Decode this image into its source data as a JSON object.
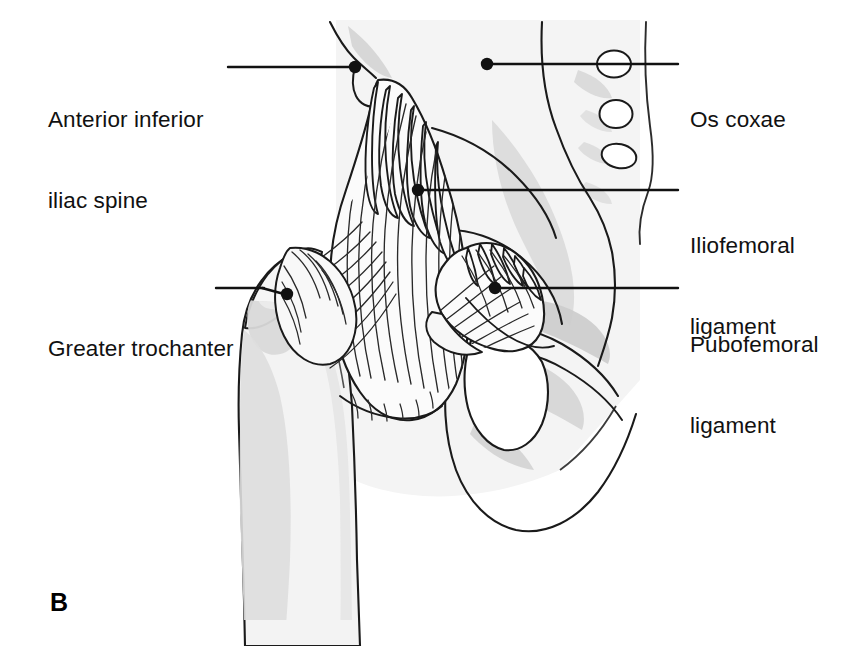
{
  "figure": {
    "panel_letter": "B",
    "view": "Anterior view of the right hip joint showing the capsular ligaments",
    "background_color": "#ffffff",
    "line_color": "#1a1a1a",
    "bone_fill_color": "#f2f2f2",
    "bone_shadow_color": "#d4d4d4",
    "ligament_fill_color": "#fbfbfb"
  },
  "labels": [
    {
      "id": "anterior-inferior-iliac-spine",
      "lines": [
        "Anterior inferior",
        "iliac spine"
      ],
      "text": "Anterior inferior iliac spine",
      "side": "left",
      "text_x": 48,
      "text_y": 52,
      "leader_start_x": 228,
      "leader_start_y": 67,
      "leader_end_x": 352,
      "leader_end_y": 67,
      "dot_x": 355,
      "dot_y": 67
    },
    {
      "id": "os-coxae",
      "lines": [
        "Os coxae"
      ],
      "text": "Os coxae",
      "side": "right",
      "text_x": 690,
      "text_y": 52,
      "leader_start_x": 490,
      "leader_start_y": 64,
      "leader_end_x": 678,
      "leader_end_y": 64,
      "dot_x": 487,
      "dot_y": 64
    },
    {
      "id": "iliofemoral-ligament",
      "lines": [
        "Iliofemoral",
        "ligament"
      ],
      "text": "Iliofemoral ligament",
      "side": "right",
      "text_x": 690,
      "text_y": 178,
      "leader_start_x": 421,
      "leader_start_y": 190,
      "leader_end_x": 678,
      "leader_end_y": 190,
      "dot_x": 418,
      "dot_y": 190
    },
    {
      "id": "pubofemoral-ligament",
      "lines": [
        "Pubofemoral",
        "ligament"
      ],
      "text": "Pubofemoral ligament",
      "side": "right",
      "text_x": 690,
      "text_y": 277,
      "leader_start_x": 498,
      "leader_start_y": 288,
      "leader_end_x": 678,
      "leader_end_y": 288,
      "dot_x": 495,
      "dot_y": 288
    },
    {
      "id": "greater-trochanter",
      "lines": [
        "Greater trochanter"
      ],
      "text": "Greater trochanter",
      "side": "left",
      "text_x": 48,
      "text_y": 281,
      "leader_start_x": 268,
      "leader_start_y": 294,
      "leader_end_x": 284,
      "leader_end_y": 294,
      "dot_x": 287,
      "dot_y": 294
    }
  ],
  "structures": [
    {
      "id": "ilium",
      "name": "Ilium (os coxae)"
    },
    {
      "id": "sacrum",
      "name": "Sacrum with anterior sacral foramina"
    },
    {
      "id": "sacral-foramina",
      "name": "Anterior sacral foramina",
      "count": 3
    },
    {
      "id": "femur",
      "name": "Femur shaft"
    },
    {
      "id": "greater-trochanter",
      "name": "Greater trochanter"
    },
    {
      "id": "iliofemoral-ligament",
      "name": "Iliofemoral ligament (Y ligament of Bigelow)"
    },
    {
      "id": "pubofemoral-ligament",
      "name": "Pubofemoral ligament"
    },
    {
      "id": "superior-pubic-ramus",
      "name": "Superior pubic ramus"
    },
    {
      "id": "obturator-foramen",
      "name": "Obturator foramen"
    },
    {
      "id": "ischium",
      "name": "Ischium"
    }
  ]
}
